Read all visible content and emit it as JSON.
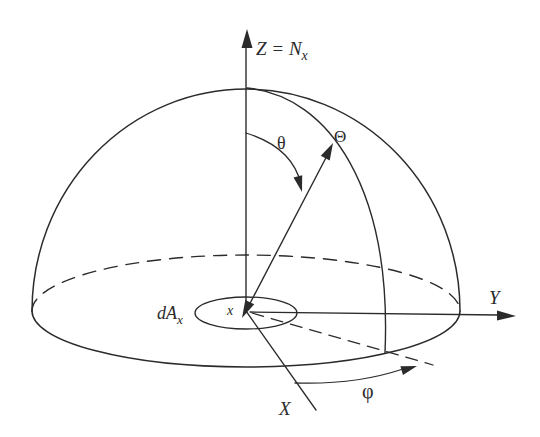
{
  "diagram": {
    "background": "#ffffff",
    "line_color": "#2b2b2b",
    "labels": {
      "z_axis": {
        "main": "Z = N",
        "sub": "x"
      },
      "y_axis": "Y",
      "x_axis": "X",
      "zenith_angle": "θ",
      "direction": "Θ",
      "azimuth_angle": "φ",
      "area_element": {
        "main": "dA",
        "sub": "x"
      },
      "surface_point": "x"
    }
  }
}
